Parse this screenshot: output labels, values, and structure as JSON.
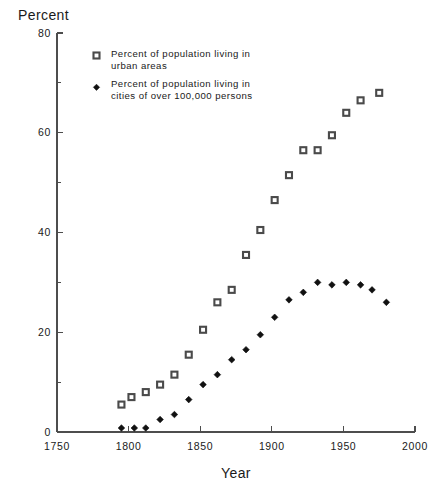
{
  "chart_data": {
    "type": "scatter",
    "title": "",
    "xlabel": "Year",
    "ylabel": "Percent",
    "xlim": [
      1750,
      2000
    ],
    "ylim": [
      0,
      80
    ],
    "xticks": [
      1750,
      1800,
      1850,
      1900,
      1950,
      2000
    ],
    "yticks": [
      0,
      20,
      40,
      60,
      80
    ],
    "y_minor_ticks": [
      10,
      30,
      50,
      70
    ],
    "grid": false,
    "legend_position": "top-left-inside",
    "series": [
      {
        "name": "Percent of population living in urban areas",
        "marker": "open-square",
        "points": [
          [
            1795,
            5.5
          ],
          [
            1802,
            7.0
          ],
          [
            1812,
            8.0
          ],
          [
            1822,
            9.5
          ],
          [
            1832,
            11.5
          ],
          [
            1842,
            15.5
          ],
          [
            1852,
            20.5
          ],
          [
            1862,
            26.0
          ],
          [
            1872,
            28.5
          ],
          [
            1882,
            35.5
          ],
          [
            1892,
            40.5
          ],
          [
            1902,
            46.5
          ],
          [
            1912,
            51.5
          ],
          [
            1922,
            56.5
          ],
          [
            1932,
            56.5
          ],
          [
            1942,
            59.5
          ],
          [
            1952,
            64.0
          ],
          [
            1962,
            66.5
          ],
          [
            1975,
            68.0
          ]
        ]
      },
      {
        "name": "Percent of population living in cities of over 100,000 persons",
        "marker": "filled-diamond",
        "points": [
          [
            1795,
            0.8
          ],
          [
            1804,
            0.8
          ],
          [
            1812,
            0.8
          ],
          [
            1822,
            2.5
          ],
          [
            1832,
            3.5
          ],
          [
            1842,
            6.5
          ],
          [
            1852,
            9.5
          ],
          [
            1862,
            11.5
          ],
          [
            1872,
            14.5
          ],
          [
            1882,
            16.5
          ],
          [
            1892,
            19.5
          ],
          [
            1902,
            23.0
          ],
          [
            1912,
            26.5
          ],
          [
            1922,
            28.0
          ],
          [
            1932,
            30.0
          ],
          [
            1942,
            29.5
          ],
          [
            1952,
            30.0
          ],
          [
            1962,
            29.5
          ],
          [
            1970,
            28.5
          ],
          [
            1980,
            26.0
          ]
        ]
      }
    ]
  },
  "axes": {
    "y_title": "Percent",
    "x_title": "Year",
    "y_tick_labels": [
      "0",
      "20",
      "40",
      "60",
      "80"
    ],
    "x_tick_labels": [
      "1750",
      "1800",
      "1850",
      "1900",
      "1950",
      "2000"
    ]
  },
  "legend": {
    "entries": [
      {
        "marker": "open-square",
        "line1": "Percent of population living in",
        "line2": "urban areas"
      },
      {
        "marker": "filled-diamond",
        "line1": "Percent of population living in",
        "line2": "cities of over 100,000 persons"
      }
    ]
  },
  "colors": {
    "background": "#ffffff",
    "axis": "#4d4d4d",
    "text": "#1a1a1a",
    "square_marker_stroke": "#4a4a4a",
    "diamond_marker_fill": "#111111"
  }
}
